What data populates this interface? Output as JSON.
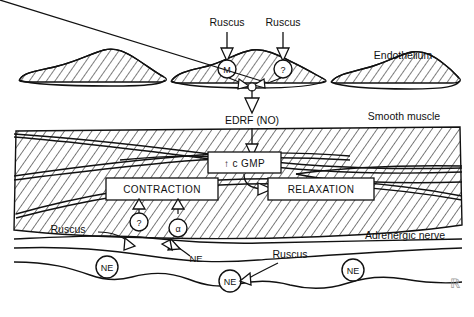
{
  "figure": {
    "line_color": "#111111",
    "background": "#ffffff"
  },
  "layers": {
    "endothelium": {
      "label": "Endothelium"
    },
    "smooth_muscle": {
      "label": "Smooth muscle"
    },
    "adrenergic_nerve": {
      "label": "Adrenergic nerve"
    }
  },
  "stimuli": {
    "top_left": "Ruscus",
    "top_right": "Ruscus",
    "nerve_left": "Ruscus",
    "nerve_mid": "Ruscus"
  },
  "receptors": {
    "endothelial_m": "M",
    "endothelial_unknown": "?",
    "muscle_unknown": "?",
    "muscle_alpha": "α"
  },
  "mediators": {
    "edrf": "EDRF (NO)",
    "cgmp": "↑ c GMP",
    "ne_label": "NE",
    "vesicles": [
      "NE",
      "NE",
      "NE"
    ]
  },
  "effects": {
    "contraction": "CONTRACTION",
    "relaxation": "RELAXATION"
  },
  "corner_mark": "ℝ"
}
